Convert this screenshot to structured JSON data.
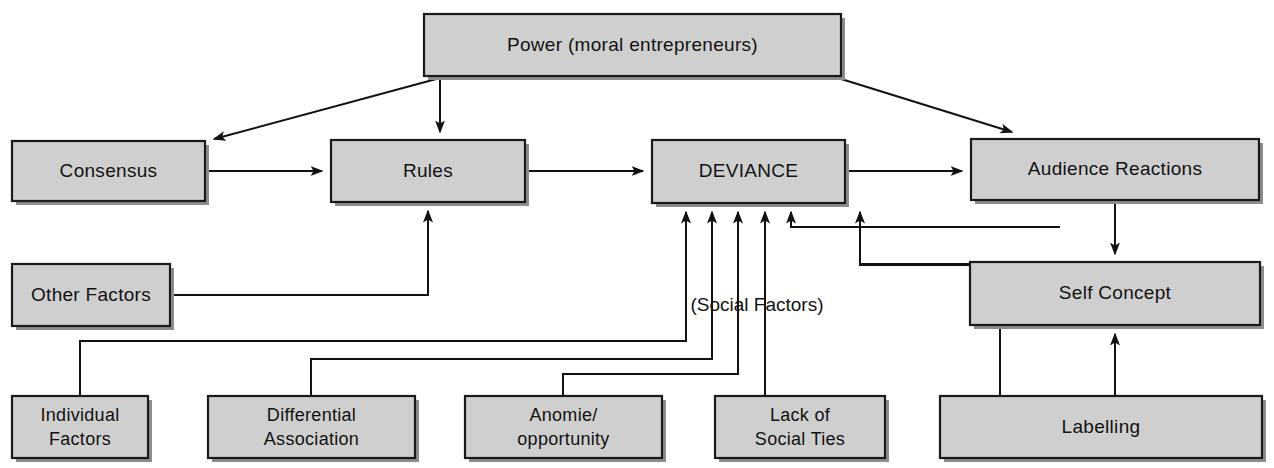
{
  "diagram": {
    "title_text": "",
    "background_color": "#ffffff",
    "box_fill_color": "#cfcfcf",
    "box_border_color": "#1a1a1a",
    "line_color": "#121212",
    "nodes": [
      {
        "id": "power",
        "label": "Power (moral entrepreneurs)",
        "x": 424,
        "y": 14,
        "w": 417,
        "h": 62
      },
      {
        "id": "consensus",
        "label": "Consensus",
        "x": 12,
        "y": 141,
        "w": 193,
        "h": 60
      },
      {
        "id": "rules",
        "label": "Rules",
        "x": 331,
        "y": 140,
        "w": 194,
        "h": 62
      },
      {
        "id": "deviance",
        "label": "DEVIANCE",
        "x": 652,
        "y": 140,
        "w": 193,
        "h": 63
      },
      {
        "id": "audience",
        "label": "Audience Reactions",
        "x": 971,
        "y": 139,
        "w": 288,
        "h": 61
      },
      {
        "id": "other",
        "label": "Other Factors",
        "x": 12,
        "y": 264,
        "w": 158,
        "h": 62
      },
      {
        "id": "self",
        "label": "Self Concept",
        "x": 970,
        "y": 262,
        "w": 290,
        "h": 63
      },
      {
        "id": "individual",
        "label": "Individual\nFactors",
        "x": 12,
        "y": 396,
        "w": 136,
        "h": 62
      },
      {
        "id": "differential",
        "label": "Differential\nAssociation",
        "x": 208,
        "y": 396,
        "w": 207,
        "h": 62
      },
      {
        "id": "anomie",
        "label": "Anomie/\nopportunity",
        "x": 465,
        "y": 396,
        "w": 197,
        "h": 62
      },
      {
        "id": "lackties",
        "label": "Lack of\nSocial Ties",
        "x": 715,
        "y": 396,
        "w": 170,
        "h": 62
      },
      {
        "id": "labelling",
        "label": "Labelling",
        "x": 940,
        "y": 396,
        "w": 322,
        "h": 62
      }
    ],
    "free_labels": [
      {
        "id": "social-factors",
        "text": "(Social Factors)",
        "x": 757,
        "y": 305
      }
    ],
    "connections": [
      {
        "from": "power",
        "to": "consensus",
        "kind": "diagonal-arrow"
      },
      {
        "from": "power",
        "to": "rules",
        "kind": "vertical-arrow"
      },
      {
        "from": "power",
        "to": "audience",
        "kind": "diagonal-arrow"
      },
      {
        "from": "consensus",
        "to": "rules",
        "kind": "horizontal-arrow"
      },
      {
        "from": "rules",
        "to": "deviance",
        "kind": "horizontal-arrow"
      },
      {
        "from": "deviance",
        "to": "audience",
        "kind": "horizontal-arrow"
      },
      {
        "from": "audience",
        "to": "self",
        "kind": "vertical-arrow"
      },
      {
        "from": "other",
        "to": "rules",
        "kind": "elbow-arrow"
      },
      {
        "from": "individual",
        "to": "deviance",
        "kind": "elbow-arrow"
      },
      {
        "from": "differential",
        "to": "deviance",
        "kind": "elbow-arrow"
      },
      {
        "from": "anomie",
        "to": "deviance",
        "kind": "elbow-arrow"
      },
      {
        "from": "lackties",
        "to": "deviance",
        "kind": "elbow-arrow"
      },
      {
        "from": "labelling",
        "to": "deviance",
        "kind": "elbow-arrow"
      },
      {
        "from": "labelling",
        "to": "self",
        "kind": "vertical-arrow"
      },
      {
        "from": "self",
        "to": "deviance",
        "kind": "elbow-arrow"
      }
    ]
  }
}
